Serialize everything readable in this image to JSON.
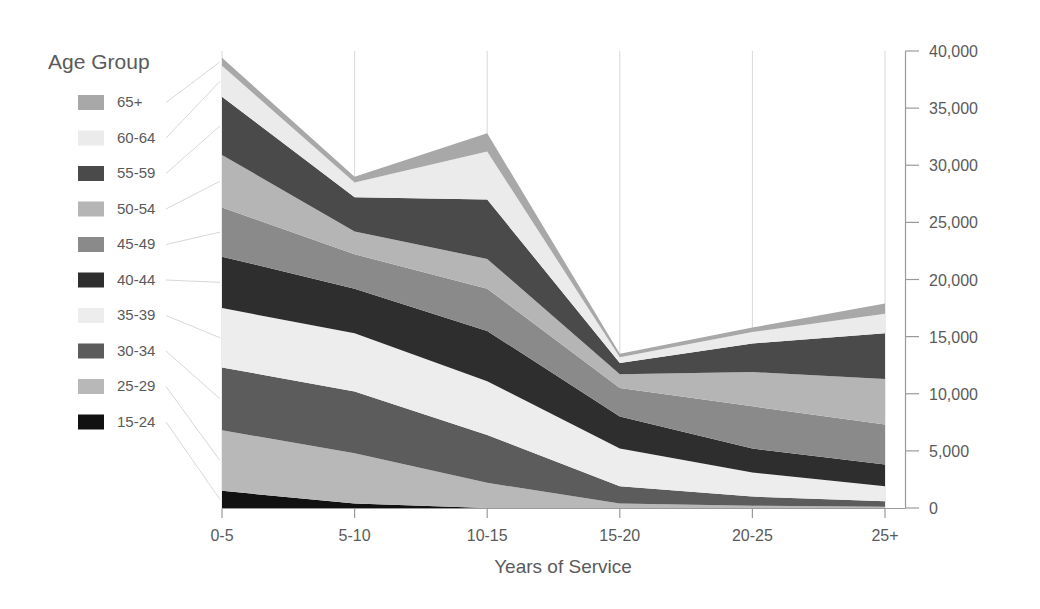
{
  "legend": {
    "title": "Age Group",
    "items": [
      {
        "label": "65+",
        "color": "#a8a8a8"
      },
      {
        "label": "60-64",
        "color": "#ebebeb"
      },
      {
        "label": "55-59",
        "color": "#4a4a4a"
      },
      {
        "label": "50-54",
        "color": "#b5b5b5"
      },
      {
        "label": "45-49",
        "color": "#8a8a8a"
      },
      {
        "label": "40-44",
        "color": "#2e2e2e"
      },
      {
        "label": "35-39",
        "color": "#ededed"
      },
      {
        "label": "30-34",
        "color": "#5c5c5c"
      },
      {
        "label": "25-29",
        "color": "#b8b8b8"
      },
      {
        "label": "15-24",
        "color": "#111111"
      }
    ]
  },
  "axes": {
    "x_title": "Years of Service",
    "x_ticks": [
      "0-5",
      "5-10",
      "10-15",
      "15-20",
      "20-25",
      "25+"
    ],
    "y_ticks": [
      "0",
      "5,000",
      "10,000",
      "15,000",
      "20,000",
      "25,000",
      "30,000",
      "35,000",
      "40,000"
    ],
    "y_position": "right"
  },
  "chart_data": {
    "type": "area",
    "stacked": true,
    "title": "",
    "xlabel": "Years of Service",
    "ylabel": "",
    "categories": [
      "0-5",
      "5-10",
      "10-15",
      "15-20",
      "20-25",
      "25+"
    ],
    "ylim": [
      0,
      40000
    ],
    "ytick_step": 5000,
    "grid": true,
    "legend_position": "left",
    "legend_title": "Age Group",
    "series": [
      {
        "name": "15-24",
        "color": "#111111",
        "values": [
          1500,
          400,
          0,
          0,
          0,
          0
        ]
      },
      {
        "name": "25-29",
        "color": "#b8b8b8",
        "values": [
          5300,
          4400,
          2200,
          400,
          200,
          100
        ]
      },
      {
        "name": "30-34",
        "color": "#5c5c5c",
        "values": [
          5500,
          5400,
          4200,
          1500,
          800,
          500
        ]
      },
      {
        "name": "35-39",
        "color": "#ededed",
        "values": [
          5200,
          5100,
          4700,
          3300,
          2100,
          1300
        ]
      },
      {
        "name": "40-44",
        "color": "#2e2e2e",
        "values": [
          4500,
          3900,
          4400,
          2800,
          2100,
          1900
        ]
      },
      {
        "name": "45-49",
        "color": "#8a8a8a",
        "values": [
          4300,
          3000,
          3700,
          2500,
          3700,
          3500
        ]
      },
      {
        "name": "50-54",
        "color": "#b5b5b5",
        "values": [
          4600,
          2000,
          2600,
          1200,
          3000,
          4000
        ]
      },
      {
        "name": "55-59",
        "color": "#4a4a4a",
        "values": [
          5100,
          3000,
          5200,
          1000,
          2500,
          4000
        ]
      },
      {
        "name": "60-64",
        "color": "#ebebeb",
        "values": [
          2700,
          1300,
          4200,
          500,
          1000,
          1700
        ]
      },
      {
        "name": "65+",
        "color": "#a8a8a8",
        "values": [
          700,
          500,
          1600,
          300,
          400,
          900
        ]
      }
    ]
  },
  "plot_geometry": {
    "left": 222,
    "right": 885,
    "top": 51,
    "bottom": 508
  }
}
